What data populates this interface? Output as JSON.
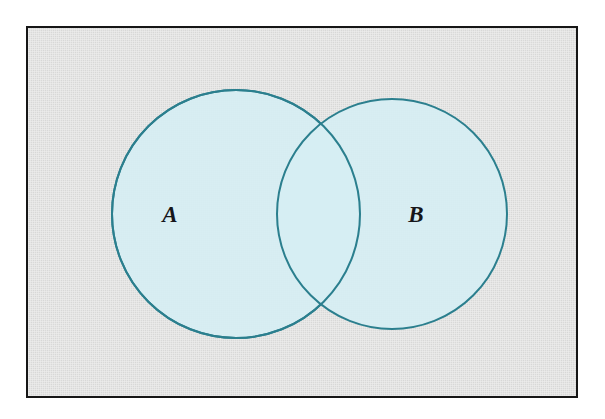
{
  "figure": {
    "kind": "venn-diagram",
    "caption": "",
    "frame": {
      "border_color": "#161616",
      "background_color": "#dededd"
    }
  },
  "chart_data": {
    "type": "venn",
    "title": "",
    "subtitle": "",
    "xlabel": "",
    "ylabel": "",
    "grid": false,
    "legend": "none",
    "annotations": [],
    "fill_color": "#d6eef3",
    "stroke_color": "#2b7f8e",
    "stroke_width": 2,
    "sets": [
      {
        "id": "A",
        "label": "A",
        "label_x": 142,
        "label_y": 194,
        "center_x": 208,
        "center_y": 186,
        "radius": 124
      },
      {
        "id": "B",
        "label": "B",
        "label_x": 388,
        "label_y": 194,
        "center_x": 364,
        "center_y": 186,
        "radius": 115
      }
    ],
    "regions": [
      {
        "id": "A-only",
        "label": ""
      },
      {
        "id": "A-and-B",
        "label": ""
      },
      {
        "id": "B-only",
        "label": ""
      }
    ]
  }
}
